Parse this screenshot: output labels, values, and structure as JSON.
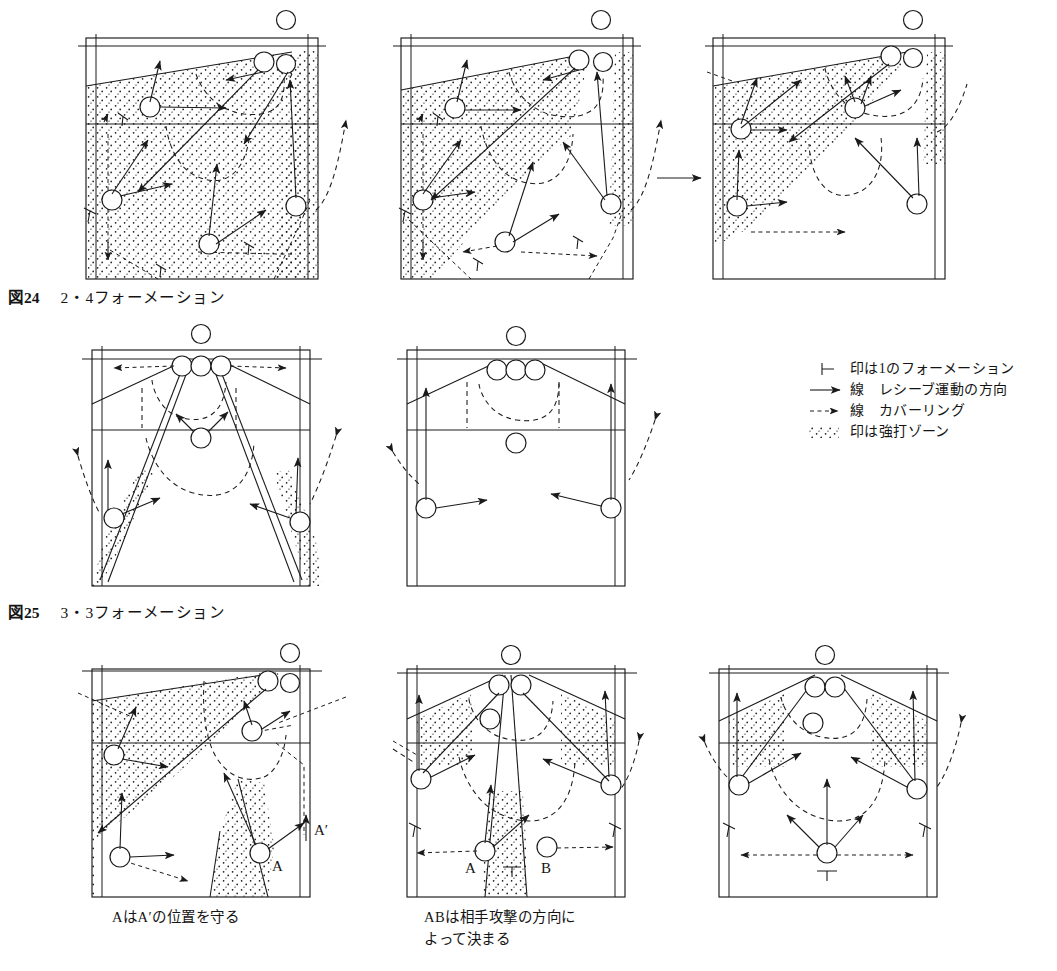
{
  "document": {
    "type": "volleyball-formation-diagrams",
    "language": "ja"
  },
  "figures": [
    {
      "id": "fig24",
      "number": "図24",
      "title": "2・4フォーメーション",
      "caption": "図24　2・4フォーメーション",
      "panel_count": 3,
      "transition_arrow": "→"
    },
    {
      "id": "fig25",
      "number": "図25",
      "title": "3・3フォーメーション",
      "caption": "図25　3・3フォーメーション",
      "panel_count": 2
    },
    {
      "id": "fig26",
      "number": "",
      "title": "",
      "caption": "",
      "panel_count": 3
    }
  ],
  "legend": {
    "items": [
      {
        "glyph": "tee-mark",
        "text": "印は1のフォーメーション",
        "prefix": "├"
      },
      {
        "glyph": "solid-arrow",
        "text": "線　レシーブ運動の方向",
        "prefix": ""
      },
      {
        "glyph": "dashed-arrow",
        "text": "線　カバーリング",
        "prefix": ""
      },
      {
        "glyph": "dot-zone",
        "text": "印は強打ゾーン",
        "prefix": ""
      }
    ]
  },
  "panel_labels": {
    "a": "A",
    "a_prime": "A′",
    "b": "B",
    "tee": "⊥"
  },
  "sub_captions": [
    {
      "id": "left",
      "text": "AはA′の位置を守る"
    },
    {
      "id": "center",
      "text": "ABは相手攻撃の方向に\nよって決まる"
    }
  ],
  "colors": {
    "ink": "#1a1a1a",
    "paper": "#ffffff"
  }
}
